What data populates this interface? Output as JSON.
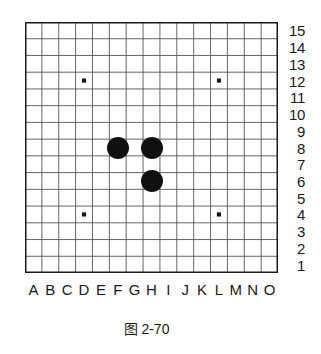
{
  "figure": {
    "caption": "图 2-70",
    "type": "go-board-diagram"
  },
  "board": {
    "size": 15,
    "columns": [
      "A",
      "B",
      "C",
      "D",
      "E",
      "F",
      "G",
      "H",
      "I",
      "J",
      "K",
      "L",
      "M",
      "N",
      "O"
    ],
    "rows": [
      "15",
      "14",
      "13",
      "12",
      "11",
      "10",
      "9",
      "8",
      "7",
      "6",
      "5",
      "4",
      "3",
      "2",
      "1"
    ],
    "grid_color": "#555555",
    "border_color": "#1a1a1a",
    "background_color": "#ffffff",
    "star_points": [
      {
        "col": "D",
        "row": "12"
      },
      {
        "col": "L",
        "row": "12"
      },
      {
        "col": "D",
        "row": "4"
      },
      {
        "col": "L",
        "row": "4"
      }
    ],
    "stones": [
      {
        "col": "F",
        "row": "8",
        "color": "black"
      },
      {
        "col": "H",
        "row": "8",
        "color": "black"
      },
      {
        "col": "H",
        "row": "6",
        "color": "black"
      }
    ],
    "stone_color_black": "#101010",
    "stone_color_white": "#ffffff"
  }
}
